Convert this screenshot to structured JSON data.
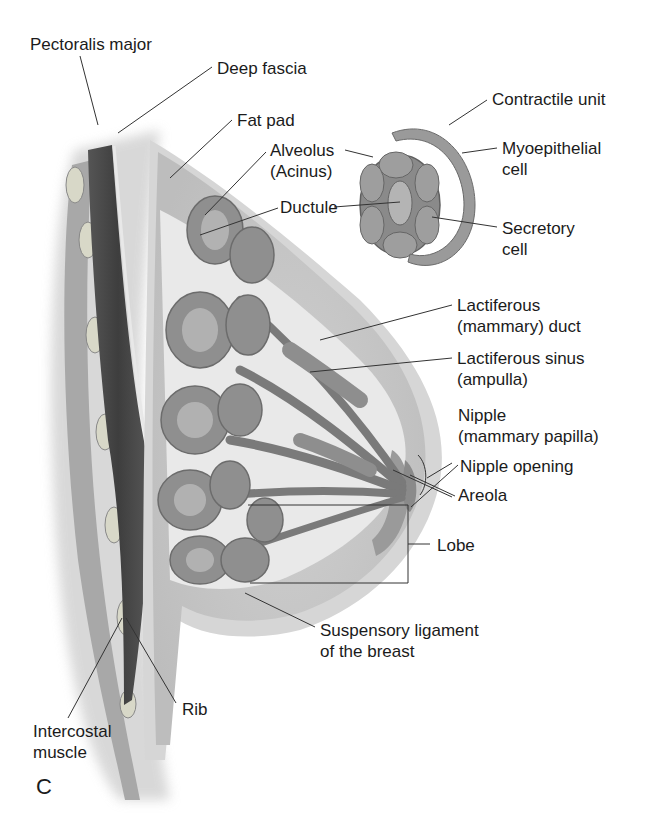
{
  "figure": {
    "panel_letter": "C",
    "colors": {
      "background": "#ffffff",
      "muscle_dark": "#4a4a4a",
      "fat_gray": "#c8c8c8",
      "gland_gray": "#8c8c8c",
      "skin_light": "#dcdcdc",
      "leader_line": "#333333"
    }
  },
  "labels": {
    "pectoralis_major": "Pectoralis major",
    "deep_fascia": "Deep fascia",
    "fat_pad": "Fat pad",
    "alveolus": [
      "Alveolus",
      "(Acinus)"
    ],
    "ductule": "Ductule",
    "contractile_unit": "Contractile unit",
    "myoepithelial_cell": [
      "Myoepithelial",
      "cell"
    ],
    "secretory_cell": [
      "Secretory",
      "cell"
    ],
    "lactiferous_duct": [
      "Lactiferous",
      "(mammary) duct"
    ],
    "lactiferous_sinus": [
      "Lactiferous sinus",
      "(ampulla)"
    ],
    "nipple": [
      "Nipple",
      "(mammary papilla)"
    ],
    "nipple_opening": "Nipple opening",
    "areola": "Areola",
    "lobe": "Lobe",
    "suspensory_ligament": [
      "Suspensory ligament",
      "of the breast"
    ],
    "rib": "Rib",
    "intercostal_muscle": [
      "Intercostal",
      "muscle"
    ]
  }
}
